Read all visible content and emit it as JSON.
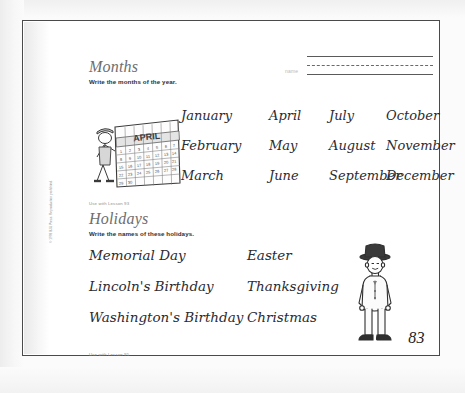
{
  "page": {
    "number": "83",
    "copyright_vertical": "© 1998 BJU Press. Reproduction prohibited."
  },
  "name_field": {
    "label": "name",
    "value": ""
  },
  "sections": [
    {
      "id": "months",
      "title": "Months",
      "instruction": "Write the months of the year.",
      "lesson_note": "Use with Lesson 93",
      "illustration": "calendar-with-boy",
      "columns": 4,
      "rows": 3,
      "entries": [
        "January",
        "April",
        "July",
        "October",
        "February",
        "May",
        "August",
        "November",
        "March",
        "June",
        "September",
        "December"
      ]
    },
    {
      "id": "holidays",
      "title": "Holidays",
      "instruction": "Write the names of these holidays.",
      "lesson_note": "Use with Lesson 95",
      "illustration": "boy-in-hat",
      "columns": 2,
      "rows": 3,
      "entries": [
        "Memorial Day",
        "Easter",
        "Lincoln's Birthday",
        "Thanksgiving",
        "Washington's Birthday",
        "Christmas"
      ]
    }
  ],
  "months_layout": {
    "col_x": [
      0,
      88,
      148,
      205
    ],
    "row_y": [
      0,
      30,
      60
    ]
  },
  "holidays_layout": {
    "col_x": [
      0,
      158
    ],
    "row_y": [
      0,
      31,
      62
    ]
  }
}
